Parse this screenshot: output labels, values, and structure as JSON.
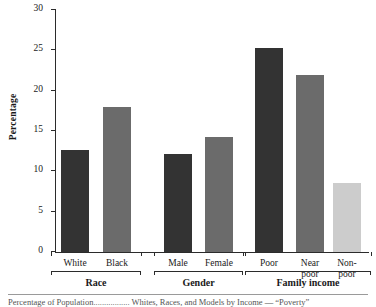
{
  "chart_data": {
    "type": "bar",
    "title": "",
    "xlabel": "",
    "ylabel": "Percentage",
    "ylim": [
      0,
      30
    ],
    "yticks": [
      0,
      5,
      10,
      15,
      20,
      25,
      30
    ],
    "ytick_labels": [
      "0",
      "5",
      "10",
      "15",
      "20",
      "25",
      "30"
    ],
    "grid": false,
    "legend": "none",
    "categories": [
      "White",
      "Black",
      "Male",
      "Female",
      "Poor",
      "Near\npoor",
      "Non-\npoor"
    ],
    "values": [
      12.6,
      18.0,
      12.2,
      14.3,
      25.3,
      22.0,
      8.6
    ],
    "bar_colors": [
      "#333333",
      "#6b6b6b",
      "#333333",
      "#6b6b6b",
      "#333333",
      "#6b6b6b",
      "#cccccc"
    ],
    "groups": [
      {
        "label": "Race",
        "categories": [
          "White",
          "Black"
        ],
        "values": [
          12.6,
          18.0
        ]
      },
      {
        "label": "Gender",
        "categories": [
          "Male",
          "Female"
        ],
        "values": [
          12.2,
          14.3
        ]
      },
      {
        "label": "Family income",
        "categories": [
          "Poor",
          "Near poor",
          "Non-poor"
        ],
        "values": [
          25.3,
          22.0,
          8.6
        ]
      }
    ]
  },
  "axis": {
    "y_label": "Percentage",
    "y_ticks": [
      "30",
      "25",
      "20",
      "15",
      "10",
      "5",
      "0"
    ]
  },
  "bars": [
    {
      "name": "white",
      "label": "White",
      "value": 12.6,
      "color": "#333333"
    },
    {
      "name": "black",
      "label": "Black",
      "value": 18.0,
      "color": "#6b6b6b"
    },
    {
      "name": "male",
      "label": "Male",
      "value": 12.2,
      "color": "#333333"
    },
    {
      "name": "female",
      "label": "Female",
      "value": 14.3,
      "color": "#6b6b6b"
    },
    {
      "name": "poor",
      "label": "Poor",
      "value": 25.3,
      "color": "#333333"
    },
    {
      "name": "near-poor",
      "label": "Near\npoor",
      "value": 22.0,
      "color": "#6b6b6b"
    },
    {
      "name": "non-poor",
      "label": "Non-\npoor",
      "value": 8.6,
      "color": "#cccccc"
    }
  ],
  "groups": [
    {
      "name": "race",
      "label": "Race"
    },
    {
      "name": "gender",
      "label": "Gender"
    },
    {
      "name": "family-income",
      "label": "Family income"
    }
  ],
  "caption": {
    "text": "Percentage of Population................. Whites, Races, and Models by Income — “Poverty”"
  }
}
